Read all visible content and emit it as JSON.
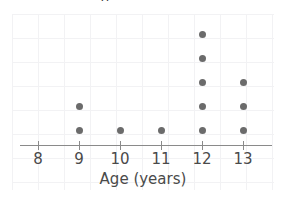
{
  "figure": {
    "cropped_title_fragment": "g",
    "background_color": "#ffffff",
    "grid_color": "#f2f2f4",
    "axis_color": "#8a8a8a",
    "dot_color": "#6b6b6b",
    "label_color": "#4a4a4a"
  },
  "axis": {
    "title": "Age (years)",
    "tick_labels": [
      "8",
      "9",
      "10",
      "11",
      "12",
      "13"
    ]
  },
  "chart_data": {
    "type": "scatter",
    "plot_style": "dot-plot",
    "title": "",
    "subtitle": "",
    "xlabel": "Age (years)",
    "ylabel": "",
    "categories": [
      8,
      9,
      10,
      11,
      12,
      13
    ],
    "values": [
      0,
      2,
      1,
      1,
      5,
      3
    ],
    "series": [
      {
        "name": "Count",
        "values": [
          0,
          2,
          1,
          1,
          5,
          3
        ]
      }
    ],
    "tick_labels": [
      "8",
      "9",
      "10",
      "11",
      "12",
      "13"
    ],
    "xlim": [
      7.5,
      13.7
    ],
    "ylim": [
      0,
      6
    ],
    "grid": true,
    "legend": "none",
    "total_count": 12,
    "annotations": [],
    "points": [
      {
        "x": 9,
        "stack": 1
      },
      {
        "x": 9,
        "stack": 2
      },
      {
        "x": 10,
        "stack": 1
      },
      {
        "x": 11,
        "stack": 1
      },
      {
        "x": 12,
        "stack": 1
      },
      {
        "x": 12,
        "stack": 2
      },
      {
        "x": 12,
        "stack": 3
      },
      {
        "x": 12,
        "stack": 4
      },
      {
        "x": 12,
        "stack": 5
      },
      {
        "x": 13,
        "stack": 1
      },
      {
        "x": 13,
        "stack": 2
      },
      {
        "x": 13,
        "stack": 3
      }
    ]
  },
  "layout": {
    "tick_x_positions": [
      38,
      79,
      120,
      161,
      202,
      243
    ],
    "baseline_y": 130,
    "row_spacing": 24
  }
}
